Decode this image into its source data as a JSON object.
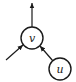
{
  "diagram": {
    "type": "directed-graph",
    "colors": {
      "stroke": "#1a1a1a",
      "background": "#ffffff"
    },
    "nodes": [
      {
        "id": "v",
        "label": "v",
        "cx": 32,
        "cy": 38,
        "r": 11
      },
      {
        "id": "u",
        "label": "u",
        "cx": 60,
        "cy": 69,
        "r": 11
      }
    ],
    "edges": [
      {
        "from": "v",
        "to": "outside-top",
        "direction": "outgoing"
      },
      {
        "from": "outside-lower-left",
        "to": "v",
        "direction": "incoming"
      },
      {
        "from": "u",
        "to": "v",
        "direction": "incoming"
      }
    ]
  }
}
